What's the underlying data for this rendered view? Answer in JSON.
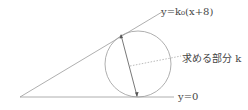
{
  "diagram": {
    "line_top_label": "y=k₀(x+8)",
    "line_bottom_label": "y=0",
    "circle_label": "求める部分 k",
    "colors": {
      "stroke": "#9a9a9a",
      "arrow": "#555555",
      "text": "#444444"
    }
  }
}
